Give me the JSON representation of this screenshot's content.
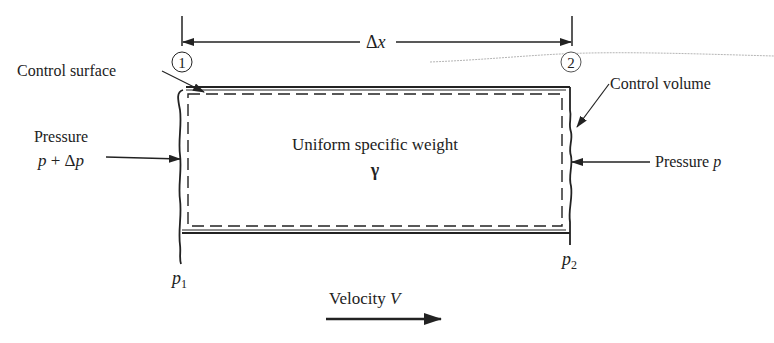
{
  "diagram": {
    "dimension": {
      "label_symbol": "Δ",
      "label_var": "x"
    },
    "stations": [
      {
        "id": "1",
        "label": "1"
      },
      {
        "id": "2",
        "label": "2"
      }
    ],
    "labels": {
      "control_surface": "Control surface",
      "control_volume": "Control volume",
      "pressure_left_line1": "Pressure",
      "pressure_left_line2_p": "p",
      "pressure_left_line2_op": " + Δ",
      "pressure_left_line2_p2": "p",
      "pressure_right_text": "Pressure ",
      "pressure_right_var": "p",
      "center_line1": "Uniform specific weight",
      "center_symbol": "γ",
      "p1_var": "p",
      "p1_sub": "1",
      "p2_var": "p",
      "p2_sub": "2",
      "velocity_text": "Velocity ",
      "velocity_var": "V"
    },
    "colors": {
      "ink": "#222222",
      "faint": "#9a9a9a",
      "background": "#ffffff"
    }
  }
}
